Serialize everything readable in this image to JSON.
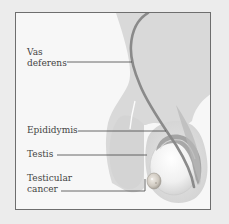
{
  "diagram": {
    "labels": [
      {
        "id": "vas-deferens",
        "line1": "Vas",
        "line2": "deferens"
      },
      {
        "id": "epididymis",
        "text": "Epididymis"
      },
      {
        "id": "testis",
        "text": "Testis"
      },
      {
        "id": "testicular-cancer",
        "line1": "Testicular",
        "line2": "cancer"
      }
    ],
    "colors": {
      "background": "#ececec",
      "frame_fill": "#f7f7f7",
      "frame_border": "#6e6e6e",
      "body_tissue": "#d9d9d9",
      "testis_fill": "#f4f4f4",
      "vas_deferens": "#8a8a8a",
      "leader_line": "#444444",
      "label_text": "#444444"
    }
  }
}
